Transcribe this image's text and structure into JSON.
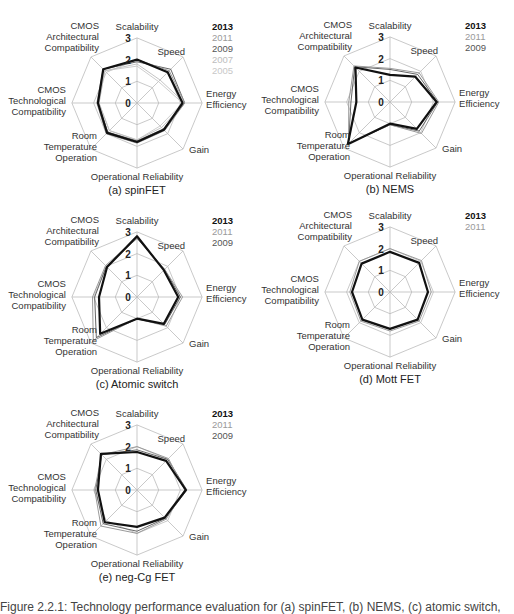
{
  "axes": [
    "Scalability",
    "Speed",
    "Energy Efficiency",
    "Gain",
    "Operational Reliability",
    "Room Temperature Operation",
    "CMOS Technological Compatibility",
    "CMOS Architectural Compatibility"
  ],
  "axis_label_lines": [
    [
      "Scalability"
    ],
    [
      "Speed"
    ],
    [
      "Energy",
      "Efficiency"
    ],
    [
      "Gain"
    ],
    [
      "Operational Reliability"
    ],
    [
      "Room",
      "Temperature",
      "Operation"
    ],
    [
      "CMOS",
      "Technological",
      "Compatibility"
    ],
    [
      "CMOS",
      "Architectural",
      "Compatibility"
    ]
  ],
  "ticks": [
    "0",
    "1",
    "2",
    "3"
  ],
  "year_styles": {
    "2013": {
      "color": "#111111",
      "width": 2.2,
      "bold": true
    },
    "2011": {
      "color": "#9a9a9a",
      "width": 1.0,
      "bold": false
    },
    "2009": {
      "color": "#555555",
      "width": 0.9,
      "bold": false
    },
    "2007": {
      "color": "#bdbdbd",
      "width": 0.9,
      "bold": false
    },
    "2005": {
      "color": "#c8c8c8",
      "width": 0.9,
      "bold": false
    }
  },
  "figure_caption": "Figure 2.2.1: Technology performance evaluation for (a) spinFET, (b) NEMS, (c) atomic switch,",
  "chart_data": [
    {
      "type": "radar",
      "id": "a",
      "caption": "(a) spinFET",
      "center": [
        137,
        103
      ],
      "legend": [
        "2013",
        "2011",
        "2009",
        "2007",
        "2005"
      ],
      "categories": [
        "Scalability",
        "Speed",
        "Energy Efficiency",
        "Gain",
        "Operational Reliability",
        "Room Temperature Operation",
        "CMOS Technological Compatibility",
        "CMOS Architectural Compatibility"
      ],
      "rlim": [
        0,
        3
      ],
      "series": [
        {
          "name": "2013",
          "values": [
            2.0,
            2.0,
            2.1,
            1.75,
            1.8,
            1.95,
            1.8,
            2.2
          ]
        },
        {
          "name": "2011",
          "values": [
            2.0,
            2.1,
            2.2,
            1.8,
            1.85,
            2.0,
            1.85,
            2.2
          ]
        },
        {
          "name": "2009",
          "values": [
            1.9,
            2.2,
            2.2,
            1.7,
            1.75,
            1.9,
            1.8,
            2.2
          ]
        },
        {
          "name": "2007",
          "values": [
            1.8,
            1.5,
            2.2,
            1.6,
            1.7,
            1.8,
            1.75,
            2.1
          ]
        },
        {
          "name": "2005",
          "values": [
            1.7,
            1.4,
            2.1,
            1.5,
            1.7,
            1.8,
            1.75,
            2.1
          ]
        }
      ]
    },
    {
      "type": "radar",
      "id": "b",
      "caption": "(b) NEMS",
      "center": [
        390,
        102
      ],
      "legend": [
        "2013",
        "2011",
        "2009"
      ],
      "categories": [
        "Scalability",
        "Speed",
        "Energy Efficiency",
        "Gain",
        "Operational Reliability",
        "Room Temperature Operation",
        "CMOS Technological Compatibility",
        "CMOS Architectural Compatibility"
      ],
      "rlim": [
        0,
        3
      ],
      "series": [
        {
          "name": "2013",
          "values": [
            1.25,
            1.65,
            2.15,
            1.75,
            1.0,
            2.75,
            1.55,
            2.25
          ]
        },
        {
          "name": "2011",
          "values": [
            1.55,
            1.9,
            2.25,
            2.05,
            1.05,
            2.7,
            1.9,
            2.35
          ]
        },
        {
          "name": "2009",
          "values": [
            1.5,
            1.8,
            2.2,
            1.9,
            1.05,
            2.7,
            1.8,
            2.3
          ]
        }
      ]
    },
    {
      "type": "radar",
      "id": "c",
      "caption": "(c) Atomic switch",
      "center": [
        137,
        297
      ],
      "legend": [
        "2013",
        "2011",
        "2009"
      ],
      "categories": [
        "Scalability",
        "Speed",
        "Energy Efficiency",
        "Gain",
        "Operational Reliability",
        "Room Temperature Operation",
        "CMOS Technological Compatibility",
        "CMOS Architectural Compatibility"
      ],
      "rlim": [
        0,
        3
      ],
      "series": [
        {
          "name": "2013",
          "values": [
            2.8,
            1.75,
            1.9,
            1.75,
            1.0,
            2.4,
            1.75,
            1.95
          ]
        },
        {
          "name": "2011",
          "values": [
            2.75,
            1.8,
            2.1,
            1.9,
            1.0,
            2.85,
            2.05,
            2.05
          ]
        },
        {
          "name": "2009",
          "values": [
            2.7,
            1.8,
            2.0,
            1.8,
            1.0,
            2.65,
            1.95,
            2.0
          ]
        }
      ]
    },
    {
      "type": "radar",
      "id": "d",
      "caption": "(d) Mott FET",
      "center": [
        390,
        292
      ],
      "legend": [
        "2013",
        "2011"
      ],
      "categories": [
        "Scalability",
        "Speed",
        "Energy Efficiency",
        "Gain",
        "Operational Reliability",
        "Room Temperature Operation",
        "CMOS Technological Compatibility",
        "CMOS Architectural Compatibility"
      ],
      "rlim": [
        0,
        3
      ],
      "series": [
        {
          "name": "2013",
          "values": [
            1.85,
            1.9,
            1.75,
            1.8,
            1.7,
            1.8,
            1.75,
            1.85
          ]
        },
        {
          "name": "2011",
          "values": [
            2.0,
            2.05,
            1.9,
            1.9,
            1.8,
            1.9,
            1.85,
            2.0
          ]
        }
      ]
    },
    {
      "type": "radar",
      "id": "e",
      "caption": "(e) neg-Cg FET",
      "center": [
        137,
        490
      ],
      "legend": [
        "2013",
        "2011",
        "2009"
      ],
      "categories": [
        "Scalability",
        "Speed",
        "Energy Efficiency",
        "Gain",
        "Operational Reliability",
        "Room Temperature Operation",
        "CMOS Technological Compatibility",
        "CMOS Architectural Compatibility"
      ],
      "rlim": [
        0,
        3
      ],
      "series": [
        {
          "name": "2013",
          "values": [
            1.75,
            1.9,
            2.25,
            1.8,
            1.7,
            2.1,
            1.8,
            2.35
          ]
        },
        {
          "name": "2011",
          "values": [
            2.0,
            2.05,
            2.2,
            1.9,
            2.0,
            2.35,
            1.95,
            2.3
          ]
        },
        {
          "name": "2009",
          "values": [
            1.85,
            2.0,
            2.3,
            1.85,
            1.9,
            2.2,
            1.9,
            2.3
          ]
        }
      ]
    }
  ]
}
